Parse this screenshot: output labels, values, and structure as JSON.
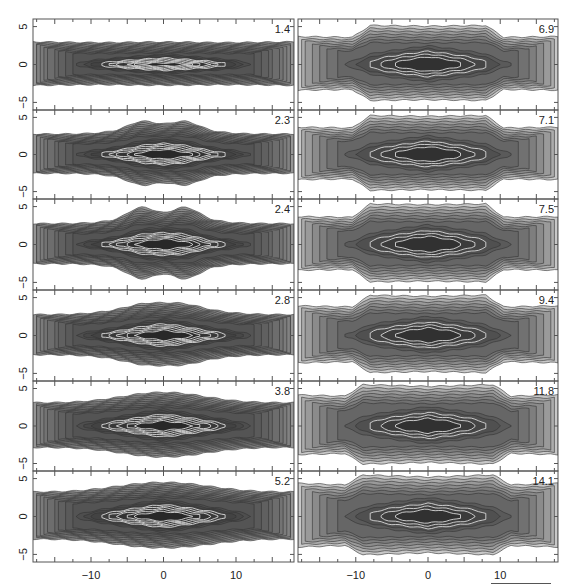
{
  "chart_data": {
    "type": "heatmap",
    "title": "",
    "layout": {
      "rows": 6,
      "cols": 2,
      "order": "column-major"
    },
    "xlabel": "",
    "ylabel": "",
    "xlim": [
      -18,
      18
    ],
    "ylim": [
      -6,
      6
    ],
    "x_ticks": [
      -10,
      0,
      10
    ],
    "x_tick_labels": [
      "−10",
      "0",
      "10"
    ],
    "y_ticks": [
      5,
      0,
      -5
    ],
    "y_tick_labels": [
      "5",
      "0",
      "−5"
    ],
    "minor_x_step": 2.5,
    "panels": [
      {
        "label": "1.4",
        "col": 0,
        "row": 0,
        "extent": 1.8,
        "bulge": 0.2,
        "bulge_width": 6,
        "core": 0.3,
        "peanut": 0,
        "flare": 0.2,
        "style": "lines"
      },
      {
        "label": "2.3",
        "col": 0,
        "row": 1,
        "extent": 1.8,
        "bulge": 1.6,
        "bulge_width": 6,
        "core": 0.8,
        "peanut": 0.5,
        "flare": 0.0,
        "style": "lines"
      },
      {
        "label": "2.4",
        "col": 0,
        "row": 2,
        "extent": 1.8,
        "bulge": 1.8,
        "bulge_width": 6,
        "core": 0.8,
        "peanut": 0.8,
        "flare": 0.0,
        "style": "lines"
      },
      {
        "label": "2.8",
        "col": 0,
        "row": 3,
        "extent": 1.8,
        "bulge": 1.6,
        "bulge_width": 7,
        "core": 0.9,
        "peanut": 0.1,
        "flare": 0.0,
        "style": "lines"
      },
      {
        "label": "3.8",
        "col": 0,
        "row": 4,
        "extent": 2.0,
        "bulge": 1.5,
        "bulge_width": 8,
        "core": 1.0,
        "peanut": 0,
        "flare": 0.1,
        "style": "lines"
      },
      {
        "label": "5.2",
        "col": 0,
        "row": 5,
        "extent": 2.0,
        "bulge": 1.5,
        "bulge_width": 9,
        "core": 1.0,
        "peanut": 0,
        "flare": 0.2,
        "style": "lines"
      },
      {
        "label": "6.9",
        "col": 1,
        "row": 0,
        "extent": 2.4,
        "bulge": 1.6,
        "bulge_width": 8,
        "core": 1.2,
        "peanut": 0,
        "flare": 0.2,
        "style": "filled",
        "box": true
      },
      {
        "label": "7.1",
        "col": 1,
        "row": 1,
        "extent": 2.4,
        "bulge": 1.7,
        "bulge_width": 8,
        "core": 1.2,
        "peanut": 0,
        "flare": 0.2,
        "style": "filled",
        "box": true
      },
      {
        "label": "7.5",
        "col": 1,
        "row": 2,
        "extent": 2.4,
        "bulge": 1.8,
        "bulge_width": 8,
        "core": 1.2,
        "peanut": 0,
        "flare": 0.2,
        "style": "filled",
        "box": true
      },
      {
        "label": "9.4",
        "col": 1,
        "row": 3,
        "extent": 2.5,
        "bulge": 1.6,
        "bulge_width": 8,
        "core": 1.2,
        "peanut": 0.3,
        "flare": 0.3,
        "style": "filled",
        "box": true
      },
      {
        "label": "11.8",
        "col": 1,
        "row": 4,
        "extent": 2.6,
        "bulge": 1.6,
        "bulge_width": 9,
        "core": 1.2,
        "peanut": 0.3,
        "flare": 0.4,
        "style": "filled",
        "box": true
      },
      {
        "label": "14.1",
        "col": 1,
        "row": 5,
        "extent": 2.7,
        "bulge": 1.4,
        "bulge_width": 9,
        "core": 1.2,
        "peanut": 0.3,
        "flare": 0.5,
        "style": "filled",
        "box": true
      }
    ],
    "annotations": [
      "scale bar below lower-right panel"
    ]
  },
  "colors": {
    "axis": "#555555",
    "contour_line": "#333333",
    "inner_contour": "#d8d8d8",
    "fill_dark": "#2a2a2a",
    "fill_light": "#bdbdbd",
    "background": "#ffffff"
  }
}
